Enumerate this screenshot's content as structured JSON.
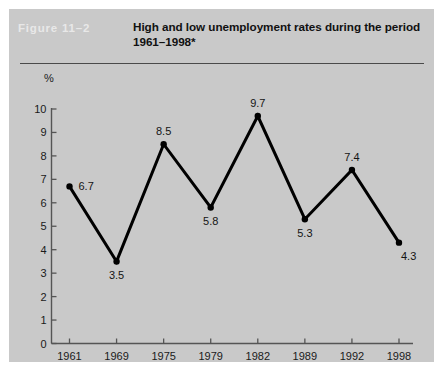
{
  "figure": {
    "number_label": "Figure 11–2",
    "title": "High and low unemployment rates during the period 1961–1998*"
  },
  "colors": {
    "panel_background": "#c9c9c9",
    "page_background": "#ffffff",
    "figure_number_color": "#e8e8e8",
    "title_color": "#111111",
    "rule_color": "#4a4a4a",
    "axis_color": "#555555",
    "line_color": "#000000",
    "label_color": "#141414"
  },
  "chart_data": {
    "type": "line",
    "title": "High and low unemployment rates during the period 1961–1998*",
    "xlabel": "",
    "ylabel": "%",
    "categories": [
      "1961",
      "1969",
      "1975",
      "1979",
      "1982",
      "1989",
      "1992",
      "1998"
    ],
    "values": [
      6.7,
      3.5,
      8.5,
      5.8,
      9.7,
      5.3,
      7.4,
      4.3
    ],
    "point_labels": [
      "6.7",
      "3.5",
      "8.5",
      "5.8",
      "9.7",
      "5.3",
      "7.4",
      "4.3"
    ],
    "ylim": [
      0,
      10
    ],
    "ytick_labels": [
      "0",
      "1",
      "2",
      "3",
      "4",
      "5",
      "6",
      "7",
      "8",
      "9",
      "10"
    ],
    "ytick_values": [
      0,
      1,
      2,
      3,
      4,
      5,
      6,
      7,
      8,
      9,
      10
    ],
    "grid": false,
    "legend": null,
    "markers": "filled-circle",
    "line_width_px": 3
  }
}
